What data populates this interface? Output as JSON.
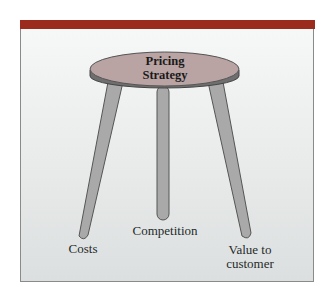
{
  "diagram": {
    "title": "Pricing Strategy",
    "seat_line1": "Pricing",
    "seat_line2": "Strategy",
    "legs": [
      {
        "label": "Costs"
      },
      {
        "label": "Competition"
      },
      {
        "label_line1": "Value to",
        "label_line2": "customer"
      }
    ],
    "colors": {
      "band": "#9b2b1c",
      "seat_top": "#b8a0a0",
      "seat_rim": "#6e6e6e",
      "leg": "#a8a8a8"
    }
  }
}
